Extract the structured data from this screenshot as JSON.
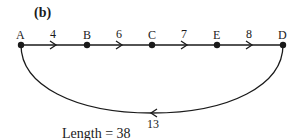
{
  "panel_label": "(b)",
  "nodes": [
    {
      "id": "A",
      "label": "A",
      "x": 21,
      "y": 45
    },
    {
      "id": "B",
      "label": "B",
      "x": 87,
      "y": 45
    },
    {
      "id": "C",
      "label": "C",
      "x": 152,
      "y": 45
    },
    {
      "id": "E",
      "label": "E",
      "x": 217,
      "y": 45
    },
    {
      "id": "D",
      "label": "D",
      "x": 283,
      "y": 45
    }
  ],
  "edges": [
    {
      "from": "A",
      "to": "B",
      "weight": "4"
    },
    {
      "from": "B",
      "to": "C",
      "weight": "6"
    },
    {
      "from": "C",
      "to": "E",
      "weight": "7"
    },
    {
      "from": "E",
      "to": "D",
      "weight": "8"
    },
    {
      "from": "D",
      "to": "A",
      "weight": "13",
      "curved": true
    }
  ],
  "length_label": "Length = 38",
  "colors": {
    "line": "#1a1a1a",
    "background": "#ffffff"
  }
}
